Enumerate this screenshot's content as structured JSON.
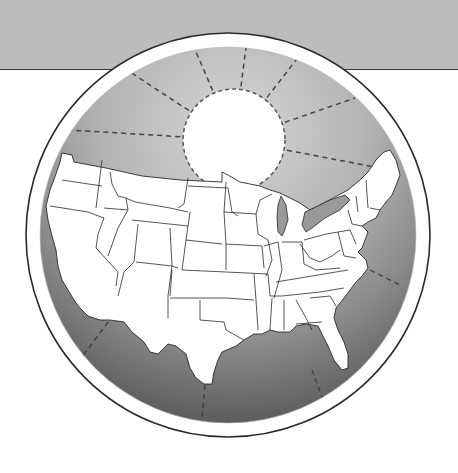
{
  "illustration": {
    "description": "Continental United States map inside a circular globe disk with a sun and dashed radiating lines",
    "colors": {
      "background": "#ffffff",
      "top_band": "#b9b9b9",
      "band_line": "#3a3a3a",
      "disk_light": "#c8c8c8",
      "disk_dark": "#6e6e6e",
      "ring": "#ffffff",
      "outline": "#2a2a2a",
      "land": "#ffffff",
      "sun": "#ffffff",
      "dash": "#444444"
    },
    "elements": [
      "top-band",
      "globe-disk",
      "sun",
      "sun-rays",
      "us-map"
    ]
  }
}
